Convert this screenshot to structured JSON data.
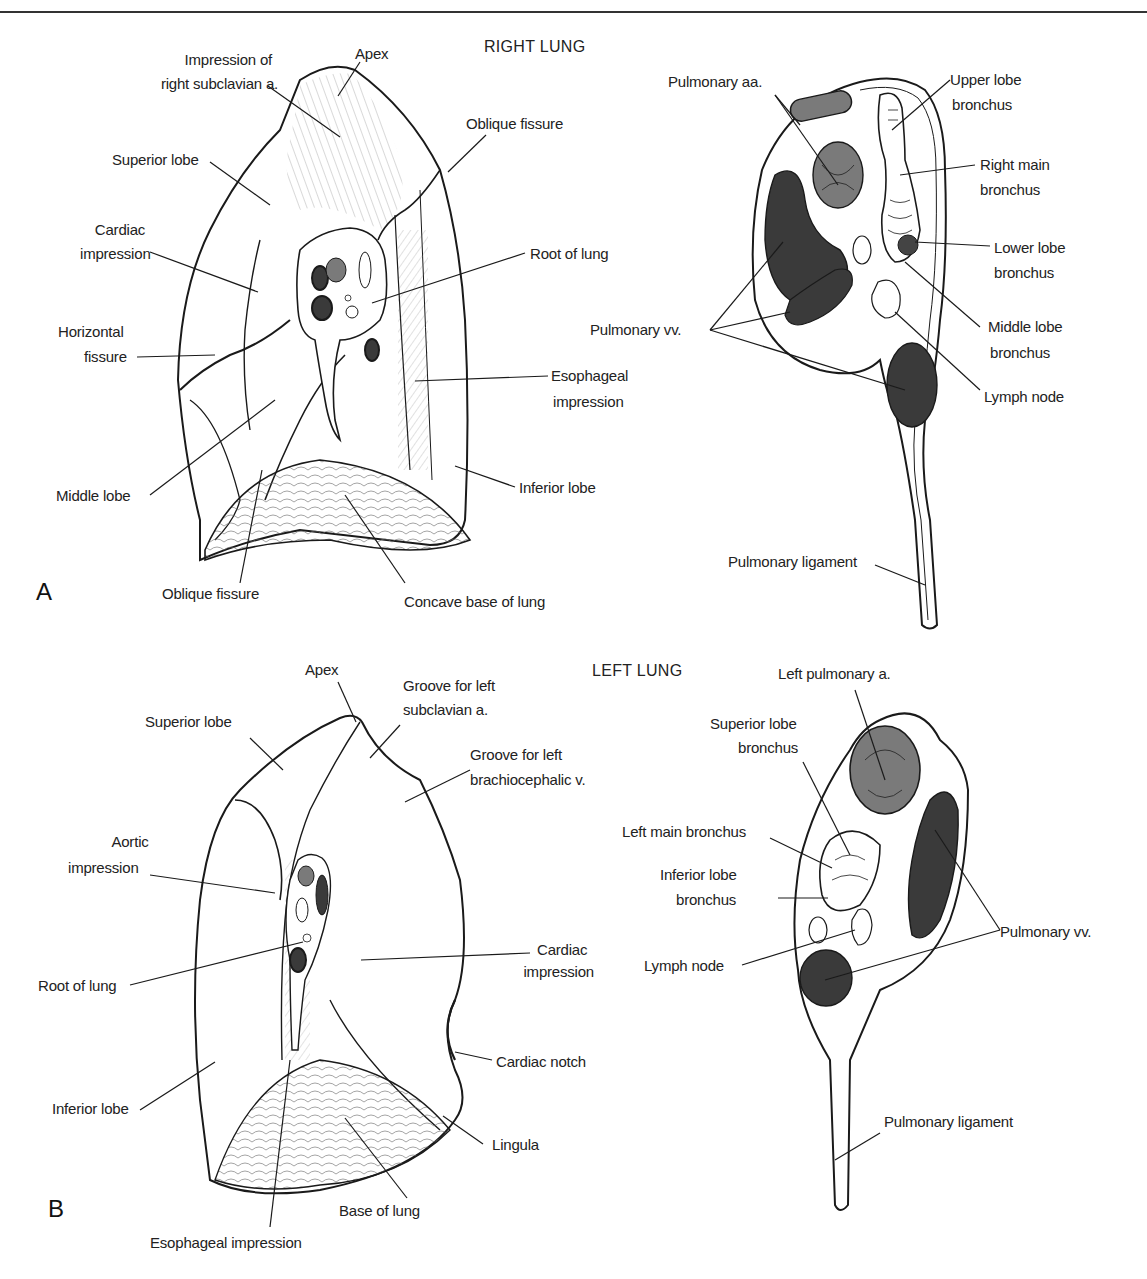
{
  "page": {
    "header_rule": true
  },
  "panel_a": {
    "letter": "A",
    "title": "RIGHT LUNG",
    "labels": {
      "impression_subclavian_1": "Impression of",
      "impression_subclavian_2": "right subclavian a.",
      "apex": "Apex",
      "oblique_fissure_top": "Oblique fissure",
      "superior_lobe": "Superior lobe",
      "cardiac_1": "Cardiac",
      "cardiac_2": "impression",
      "root_of_lung": "Root of lung",
      "horizontal_1": "Horizontal",
      "horizontal_2": "fissure",
      "esophageal_1": "Esophageal",
      "esophageal_2": "impression",
      "middle_lobe": "Middle lobe",
      "inferior_lobe": "Inferior lobe",
      "oblique_fissure_bottom": "Oblique fissure",
      "concave_base": "Concave base of lung"
    },
    "root_labels": {
      "pulmonary_aa": "Pulmonary aa.",
      "upper_lobe_1": "Upper lobe",
      "upper_lobe_2": "bronchus",
      "right_main_1": "Right main",
      "right_main_2": "bronchus",
      "lower_lobe_1": "Lower lobe",
      "lower_lobe_2": "bronchus",
      "pulmonary_vv": "Pulmonary vv.",
      "middle_lobe_1": "Middle lobe",
      "middle_lobe_2": "bronchus",
      "lymph_node": "Lymph node",
      "pulmonary_ligament": "Pulmonary ligament"
    }
  },
  "panel_b": {
    "letter": "B",
    "title": "LEFT LUNG",
    "labels": {
      "apex": "Apex",
      "groove_subclavian_1": "Groove for left",
      "groove_subclavian_2": "subclavian a.",
      "superior_lobe": "Superior lobe",
      "groove_brachio_1": "Groove for left",
      "groove_brachio_2": "brachiocephalic v.",
      "aortic_1": "Aortic",
      "aortic_2": "impression",
      "cardiac_1": "Cardiac",
      "cardiac_2": "impression",
      "root_of_lung": "Root of lung",
      "cardiac_notch": "Cardiac notch",
      "inferior_lobe": "Inferior lobe",
      "lingula": "Lingula",
      "base_of_lung": "Base of lung",
      "esophageal_impression": "Esophageal impression"
    },
    "root_labels": {
      "left_pulmonary_a": "Left pulmonary a.",
      "superior_lobe_1": "Superior lobe",
      "superior_lobe_2": "bronchus",
      "left_main": "Left main bronchus",
      "inferior_lobe_1": "Inferior lobe",
      "inferior_lobe_2": "bronchus",
      "pulmonary_vv": "Pulmonary vv.",
      "lymph_node": "Lymph node",
      "pulmonary_ligament": "Pulmonary ligament"
    }
  },
  "colors": {
    "ink": "#1a1a1a",
    "artery_fill": "#7a7a7a",
    "vein_fill": "#3a3a3a",
    "paper": "#ffffff"
  }
}
